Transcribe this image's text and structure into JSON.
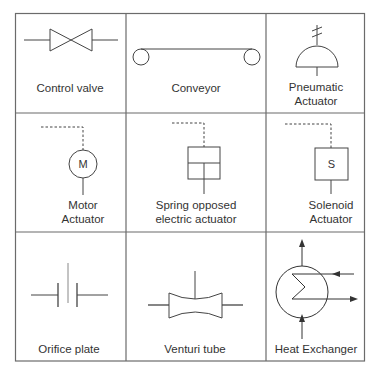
{
  "grid": {
    "rows": 3,
    "cols": 3,
    "line_color": "#6b6b6b"
  },
  "cells": [
    {
      "id": "control-valve",
      "label_lines": [
        "Control valve"
      ]
    },
    {
      "id": "conveyor",
      "label_lines": [
        "Conveyor"
      ]
    },
    {
      "id": "pneumatic-actuator",
      "label_lines": [
        "Pneumatic",
        "Actuator"
      ]
    },
    {
      "id": "motor-actuator",
      "label_lines": [
        "Motor",
        "Actuator"
      ],
      "symbol_letter": "M"
    },
    {
      "id": "spring-opposed-electric-actuator",
      "label_lines": [
        "Spring opposed",
        "electric actuator"
      ]
    },
    {
      "id": "solenoid-actuator",
      "label_lines": [
        "Solenoid",
        "Actuator"
      ],
      "symbol_letter": "S"
    },
    {
      "id": "orifice-plate",
      "label_lines": [
        "Orifice plate"
      ]
    },
    {
      "id": "venturi-tube",
      "label_lines": [
        "Venturi tube"
      ]
    },
    {
      "id": "heat-exchanger",
      "label_lines": [
        "Heat Exchanger"
      ]
    }
  ]
}
